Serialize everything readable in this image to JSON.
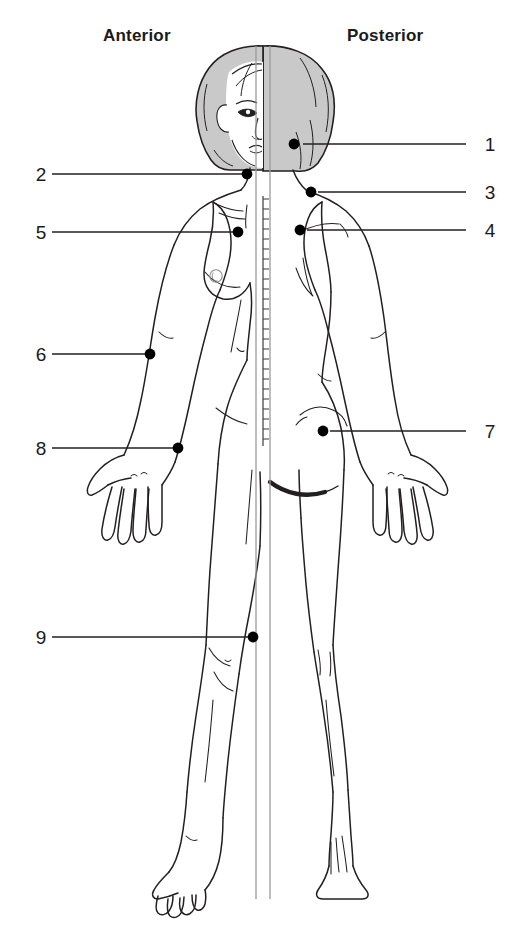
{
  "diagram": {
    "title_anterior": "Anterior",
    "title_posterior": "Posterior",
    "figure_description": "female-body-split-anterior-posterior",
    "colors": {
      "outline": "#231f20",
      "hair_fill": "#c9c9c9",
      "marker": "#000000",
      "leader_line": "#231f20",
      "background": "#ffffff"
    },
    "markers": [
      {
        "id": "1",
        "label": "1",
        "side": "right",
        "dot_x": 294,
        "dot_y": 144,
        "label_x": 480,
        "label_y": 135,
        "line_x1": 303,
        "line_x2": 466,
        "line_y": 144
      },
      {
        "id": "2",
        "label": "2",
        "side": "left",
        "dot_x": 247,
        "dot_y": 174,
        "label_x": 31,
        "label_y": 165,
        "line_x1": 52,
        "line_x2": 243,
        "line_y": 174
      },
      {
        "id": "3",
        "label": "3",
        "side": "right",
        "dot_x": 311,
        "dot_y": 192,
        "label_x": 480,
        "label_y": 183,
        "line_x1": 318,
        "line_x2": 466,
        "line_y": 192
      },
      {
        "id": "4",
        "label": "4",
        "side": "right",
        "dot_x": 300,
        "dot_y": 230,
        "label_x": 480,
        "label_y": 221,
        "line_x1": 307,
        "line_x2": 466,
        "line_y": 230
      },
      {
        "id": "5",
        "label": "5",
        "side": "left",
        "dot_x": 238,
        "dot_y": 232,
        "label_x": 31,
        "label_y": 223,
        "line_x1": 52,
        "line_x2": 234,
        "line_y": 232
      },
      {
        "id": "6",
        "label": "6",
        "side": "left",
        "dot_x": 150,
        "dot_y": 354,
        "label_x": 31,
        "label_y": 345,
        "line_x1": 52,
        "line_x2": 146,
        "line_y": 354
      },
      {
        "id": "7",
        "label": "7",
        "side": "right",
        "dot_x": 323,
        "dot_y": 431,
        "label_x": 480,
        "label_y": 422,
        "line_x1": 330,
        "line_x2": 466,
        "line_y": 431
      },
      {
        "id": "8",
        "label": "8",
        "side": "left",
        "dot_x": 178,
        "dot_y": 448,
        "label_x": 31,
        "label_y": 439,
        "line_x1": 52,
        "line_x2": 174,
        "line_y": 448
      },
      {
        "id": "9",
        "label": "9",
        "side": "left",
        "dot_x": 253,
        "dot_y": 637,
        "label_x": 31,
        "label_y": 628,
        "line_x1": 52,
        "line_x2": 249,
        "line_y": 637
      }
    ],
    "anatomy_features": [
      "head-split-face-and-hair",
      "dashed-spine-midline",
      "anterior-breast-nipple",
      "anterior-open-hand-fingers",
      "posterior-open-hand-fingers",
      "posterior-gluteal-fold",
      "anterior-foot-toes",
      "posterior-foot-heel"
    ]
  }
}
